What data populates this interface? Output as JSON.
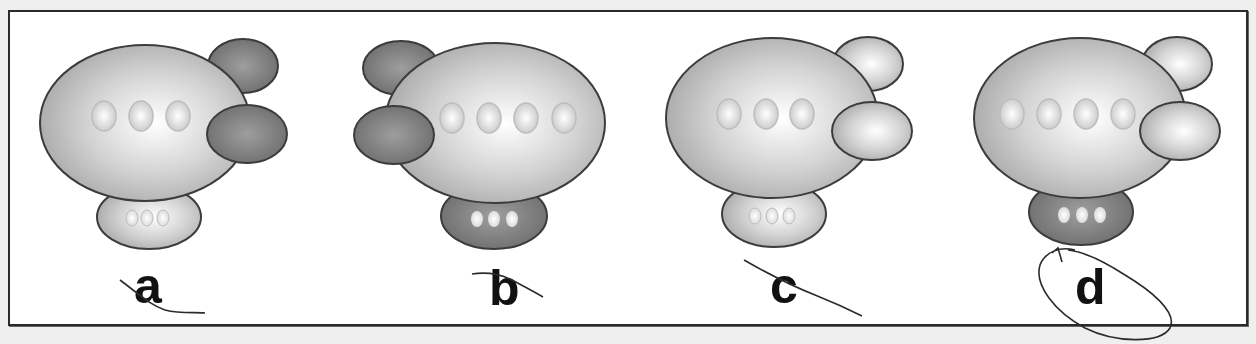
{
  "figure": {
    "colors": {
      "background": "#efefef",
      "frame_border": "#2a2a2a",
      "light_fill_center": "#ffffff",
      "light_fill_edge": "#a9a9a9",
      "dark_fill_center": "#9a9a9a",
      "dark_fill_edge": "#6a6a6a",
      "outline": "#3c3c3c",
      "pencil": "#2b2b2b"
    },
    "options": [
      {
        "label": "a",
        "fins_side": "right",
        "fins_shade": "dark",
        "body_windows": 3,
        "gondola_shade": "light",
        "gondola_windows": 3,
        "mark": "crossed-out"
      },
      {
        "label": "b",
        "fins_side": "left",
        "fins_shade": "dark",
        "body_windows": 4,
        "gondola_shade": "dark",
        "gondola_windows": 3,
        "mark": "crossed-out"
      },
      {
        "label": "c",
        "fins_side": "right",
        "fins_shade": "light",
        "body_windows": 3,
        "gondola_shade": "light",
        "gondola_windows": 3,
        "mark": "crossed-out"
      },
      {
        "label": "d",
        "fins_side": "right",
        "fins_shade": "light",
        "body_windows": 4,
        "gondola_shade": "dark",
        "gondola_windows": 3,
        "mark": "circled"
      }
    ],
    "selected_answer": "d"
  }
}
